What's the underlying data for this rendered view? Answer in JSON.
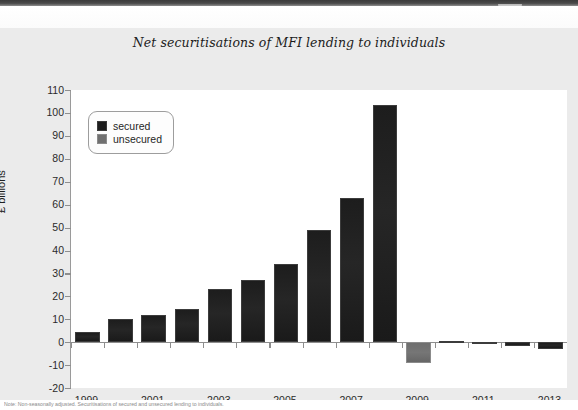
{
  "window": {
    "top_bar_color": "#3f3f3f",
    "panel_background": "#ebebeb"
  },
  "chart": {
    "title": "Net securitisations of MFI lending to individuals",
    "y_axis_title": "£ billions",
    "legend": [
      {
        "key": "secured",
        "label": "secured",
        "color": "#1d1d1d"
      },
      {
        "key": "unsecured",
        "label": "unsecured",
        "color": "#707070"
      }
    ],
    "y_ticks": [
      "110",
      "100",
      "90",
      "80",
      "70",
      "60",
      "50",
      "40",
      "30",
      "20",
      "10",
      "0",
      "-10",
      "-20"
    ],
    "x_ticks": [
      "1999",
      "2001",
      "2003",
      "2005",
      "2007",
      "2009",
      "2011",
      "2013"
    ]
  },
  "footnote": {
    "text": "Note: Non-seasonally adjusted. Securitisations of secured and unsecured lending to individuals."
  },
  "chart_data": {
    "type": "bar",
    "title": "Net securitisations of MFI lending to individuals",
    "xlabel": "",
    "ylabel": "£ billions",
    "ylim": [
      -20,
      110
    ],
    "ytick_step": 10,
    "grid": false,
    "legend_position": "top-left",
    "categories": [
      "1999",
      "2000",
      "2001",
      "2002",
      "2003",
      "2004",
      "2005",
      "2006",
      "2007",
      "2008",
      "2009",
      "2010",
      "2011",
      "2012",
      "2013"
    ],
    "series": [
      {
        "name": "secured",
        "color": "#1d1d1d",
        "values": [
          4.5,
          10.0,
          12.0,
          14.5,
          23.0,
          27.0,
          34.0,
          49.0,
          63.0,
          103.5,
          null,
          0.6,
          -1.0,
          -1.5,
          -3.0
        ]
      },
      {
        "name": "unsecured",
        "color": "#707070",
        "values": [
          null,
          null,
          null,
          null,
          null,
          null,
          null,
          null,
          null,
          null,
          -9.0,
          null,
          null,
          null,
          null
        ]
      }
    ]
  }
}
